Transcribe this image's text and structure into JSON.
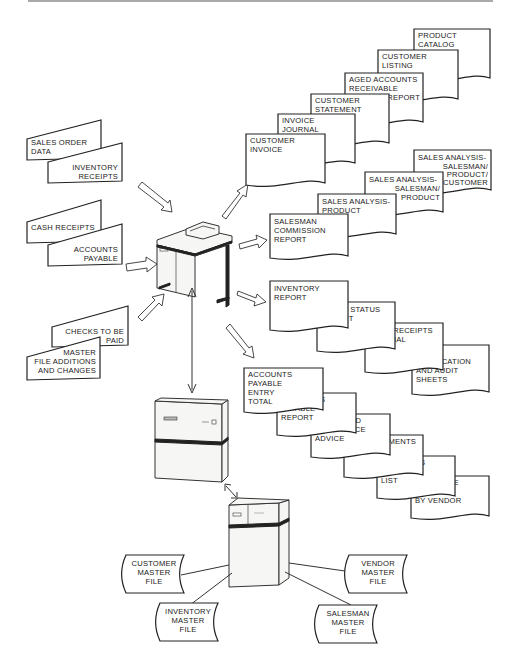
{
  "diagram": {
    "type": "system flow",
    "inputs": [
      {
        "id": "sales-order-data",
        "lines": [
          "SALES ORDER",
          "DATA"
        ]
      },
      {
        "id": "inventory-receipts",
        "lines": [
          "INVENTORY",
          "RECEIPTS"
        ]
      },
      {
        "id": "cash-receipts",
        "lines": [
          "CASH RECEIPTS"
        ]
      },
      {
        "id": "accounts-payable",
        "lines": [
          "ACCOUNTS",
          "PAYABLE"
        ]
      },
      {
        "id": "checks-to-be-paid",
        "lines": [
          "CHECKS TO BE",
          "PAID"
        ]
      },
      {
        "id": "master-file-additions",
        "lines": [
          "MASTER",
          "FILE ADDITIONS",
          "AND CHANGES"
        ]
      }
    ],
    "output_groups": [
      {
        "name": "receivables",
        "reports": [
          {
            "id": "customer-invoice",
            "lines": [
              "CUSTOMER",
              "INVOICE"
            ]
          },
          {
            "id": "invoice-journal",
            "lines": [
              "INVOICE",
              "JOURNAL"
            ]
          },
          {
            "id": "customer-statement",
            "lines": [
              "CUSTOMER",
              "STATEMENT"
            ]
          },
          {
            "id": "aged-accounts-receivable",
            "lines": [
              "AGED ACCOUNTS",
              "RECEIVABLE",
              "REPORT"
            ]
          },
          {
            "id": "customer-listing",
            "lines": [
              "CUSTOMER",
              "LISTING"
            ]
          },
          {
            "id": "product-catalog",
            "lines": [
              "PRODUCT",
              "CATALOG"
            ]
          }
        ]
      },
      {
        "name": "sales-analysis",
        "reports": [
          {
            "id": "salesman-commission-report",
            "lines": [
              "SALESMAN",
              "COMMISSION",
              "REPORT"
            ]
          },
          {
            "id": "sales-analysis-product",
            "lines": [
              "SALES ANALYSIS-",
              "PRODUCT"
            ]
          },
          {
            "id": "sales-analysis-salesman-product",
            "lines": [
              "SALES ANALYSIS-",
              "SALESMAN/",
              "PRODUCT"
            ]
          },
          {
            "id": "sales-analysis-salesman-product-customer",
            "lines": [
              "SALES ANALYSIS-",
              "SALESMAN/",
              "PRODUCT/",
              "CUSTOMER"
            ]
          }
        ]
      },
      {
        "name": "inventory",
        "reports": [
          {
            "id": "inventory-report",
            "lines": [
              "INVENTORY",
              "REPORT"
            ]
          },
          {
            "id": "stock-status-report",
            "lines": [
              "STOCK STATUS",
              "REPORT"
            ]
          },
          {
            "id": "cash-receipts-journal",
            "lines": [
              "CASH RECEIPTS",
              "JOURNAL"
            ]
          },
          {
            "id": "input-verification",
            "lines": [
              "INPUT",
              "VERIFICATION",
              "AND AUDIT",
              "SHEETS"
            ]
          }
        ]
      },
      {
        "name": "payables",
        "reports": [
          {
            "id": "accounts-payable-entry-total",
            "lines": [
              "ACCOUNTS",
              "PAYABLE",
              "ENTRY",
              "TOTAL"
            ]
          },
          {
            "id": "accounts-payable-report",
            "lines": [
              "ACCOUNTS",
              "PAYABLE",
              "REPORT"
            ]
          },
          {
            "id": "check-and-remittance-advice",
            "lines": [
              "CHECK AND",
              "REMITTANCE",
              "ADVICE"
            ]
          },
          {
            "id": "disbursements-journal",
            "lines": [
              "DISBURSEMENTS",
              "JOURNAL"
            ]
          },
          {
            "id": "accounts-payable-list",
            "lines": [
              "ACCOUNTS",
              "PAYABLE",
              "LIST"
            ]
          },
          {
            "id": "purchase-analysis-by-vendor",
            "lines": [
              "PURCHASE",
              "ANALYSIS",
              "BY VENDOR"
            ]
          }
        ]
      }
    ],
    "master_files": [
      {
        "id": "customer-master-file",
        "lines": [
          "CUSTOMER",
          "MASTER",
          "FILE"
        ]
      },
      {
        "id": "inventory-master-file",
        "lines": [
          "INVENTORY",
          "MASTER",
          "FILE"
        ]
      },
      {
        "id": "vendor-master-file",
        "lines": [
          "VENDOR",
          "MASTER",
          "FILE"
        ]
      },
      {
        "id": "salesman-master-file",
        "lines": [
          "SALESMAN",
          "MASTER",
          "FILE"
        ]
      }
    ],
    "equipment": [
      "terminal-desk",
      "processor-cabinet",
      "disk-storage-unit"
    ]
  }
}
